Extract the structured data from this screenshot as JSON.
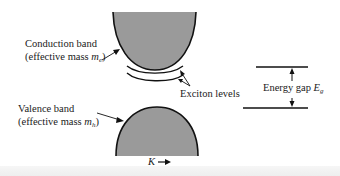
{
  "diagram": {
    "conduction_band": {
      "label": "Conduction band",
      "sublabel_prefix": "(effective mass ",
      "mass_symbol": "m",
      "mass_subscript": "e",
      "sublabel_suffix": ")"
    },
    "valence_band": {
      "label": "Valence band",
      "sublabel_prefix": "(effective mass ",
      "mass_symbol": "m",
      "mass_subscript": "h",
      "sublabel_suffix": ")"
    },
    "exciton_levels": {
      "label": "Exciton levels"
    },
    "energy_gap": {
      "label": "Energy gap ",
      "symbol": "E",
      "subscript": "g"
    },
    "k_axis": {
      "label": "K",
      "arrow": "→"
    },
    "colors": {
      "band_fill": "#9a9a9a",
      "line": "#111111",
      "background": "#ffffff"
    }
  }
}
